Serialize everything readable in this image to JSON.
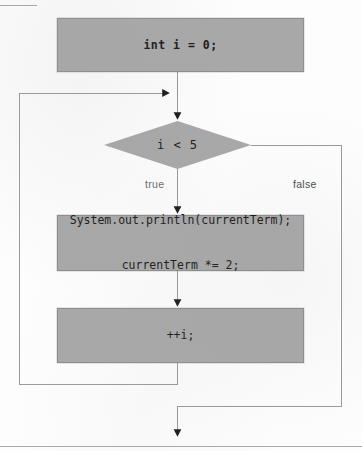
{
  "figure": {
    "type": "flowchart",
    "fill_color": "#a8a8a8",
    "stroke_color": "#8d8d8d",
    "connector_color": "#9a9a9a",
    "arrow_color": "#1a1a1a",
    "text_color": "#1a1a1a"
  },
  "nodes": {
    "init": {
      "shape": "process",
      "text": "int i = 0;"
    },
    "decision": {
      "shape": "diamond",
      "text": "i < 5"
    },
    "body": {
      "shape": "process",
      "line1": "System.out.println(currentTerm);",
      "line2": "currentTerm *= 2;"
    },
    "increment": {
      "shape": "process",
      "text": "++i;"
    }
  },
  "branches": {
    "true_label": "true",
    "false_label": "false"
  },
  "edges": [
    {
      "name": "init-to-junction",
      "from": "init",
      "to": "loop-junction"
    },
    {
      "name": "junction-to-decision",
      "from": "loop-junction",
      "to": "decision"
    },
    {
      "name": "decision-true-to-body",
      "from": "decision",
      "to": "body",
      "label": "true"
    },
    {
      "name": "body-to-increment",
      "from": "body",
      "to": "increment"
    },
    {
      "name": "increment-loopback",
      "from": "increment",
      "to": "loop-junction"
    },
    {
      "name": "decision-false-exit",
      "from": "decision",
      "to": "exit",
      "label": "false"
    }
  ]
}
